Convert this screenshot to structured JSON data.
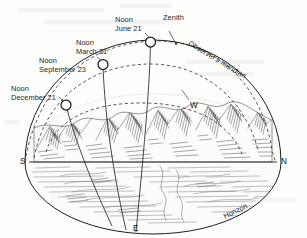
{
  "figure": {
    "background_color": "#fdfdfc",
    "ink_color": "#1d1d1d"
  },
  "labels": {
    "zenith": "Zenith",
    "observers_meridian": "Observer's meridian",
    "horizon": "Horizon",
    "noon_june": {
      "line1": "Noon",
      "line2": "June 21"
    },
    "noon_march": {
      "line1": "Noon",
      "line2": "March 21"
    },
    "noon_september": {
      "line1": "Noon",
      "line2": "September 23"
    },
    "noon_december": {
      "line1": "Noon",
      "line2": "December 21"
    }
  },
  "compass": {
    "south": "S",
    "north": "N",
    "east": "E",
    "west": "W"
  },
  "sun_markers": [
    {
      "name": "sun-june-21",
      "cx": 150.5,
      "cy": 42.0,
      "r": 5.0
    },
    {
      "name": "sun-march-21-september-23",
      "cx": 103.0,
      "cy": 64.5,
      "r": 5.0
    },
    {
      "name": "sun-december-21",
      "cx": 66.0,
      "cy": 105.0,
      "r": 5.0
    }
  ],
  "geometry": {
    "dome_center_x": 153,
    "dome_center_y": 162,
    "dome_radius_x": 128,
    "dome_radius_y": 125,
    "horizon_line_y": 162,
    "horizon_left_x": 29,
    "horizon_right_x": 277
  }
}
